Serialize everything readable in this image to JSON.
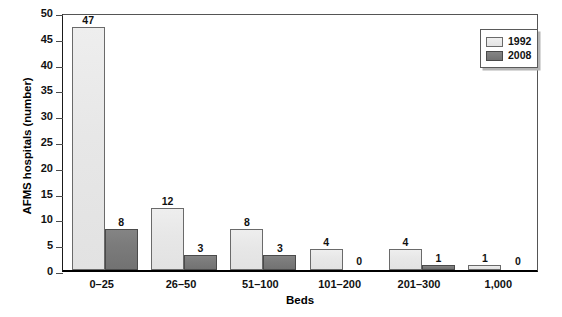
{
  "chart_data": {
    "type": "bar",
    "title": "",
    "xlabel": "Beds",
    "ylabel": "AFMS hospitals (number)",
    "categories": [
      "0–25",
      "26–50",
      "51–100",
      "101–200",
      "201–300",
      "1,000"
    ],
    "series": [
      {
        "name": "1992",
        "color": "#e7e7e7",
        "values": [
          47,
          12,
          8,
          4,
          4,
          1
        ]
      },
      {
        "name": "2008",
        "color": "#787878",
        "values": [
          8,
          3,
          3,
          0,
          1,
          0
        ]
      }
    ],
    "ylim": [
      0,
      50
    ],
    "yticks": [
      0,
      5,
      10,
      15,
      20,
      25,
      30,
      35,
      40,
      45,
      50
    ],
    "ytick_labels": [
      "0",
      "5",
      "10",
      "15",
      "20",
      "25",
      "30",
      "35",
      "40",
      "45",
      "50"
    ],
    "grid": false,
    "legend_position": "top-right",
    "value_labels": [
      [
        "47",
        "12",
        "8",
        "4",
        "4",
        "1"
      ],
      [
        "8",
        "3",
        "3",
        "0",
        "1",
        "0"
      ]
    ]
  },
  "legend": {
    "items": [
      {
        "label": "1992"
      },
      {
        "label": "2008"
      }
    ]
  }
}
